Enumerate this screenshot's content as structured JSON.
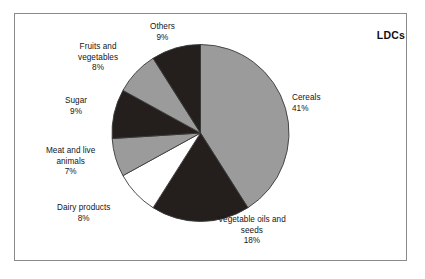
{
  "corner_tag": "LDCs",
  "chart_data": {
    "type": "pie",
    "title": "",
    "subtitle": "",
    "xlabel": "",
    "ylabel": "",
    "legend_position": "none",
    "grid": false,
    "annotation": "LDCs",
    "start_angle_deg": 0,
    "direction": "clockwise",
    "categories": [
      "Cereals",
      "Vegetable oils and seeds",
      "Dairy products",
      "Meat and live animals",
      "Sugar",
      "Fruits and vegetables",
      "Others"
    ],
    "values": [
      41,
      18,
      8,
      7,
      9,
      8,
      9
    ],
    "value_labels": [
      "41%",
      "18%",
      "8%",
      "7%",
      "9%",
      "8%",
      "9%"
    ],
    "colors": [
      "#9b9b9b",
      "#241f1c",
      "#ffffff",
      "#9b9b9b",
      "#241f1c",
      "#9b9b9b",
      "#241f1c"
    ],
    "slices": [
      {
        "label": "Cereals",
        "label_line1": "Cereals",
        "label_line2": "",
        "value": 41,
        "value_label": "41%",
        "color": "#9b9b9b"
      },
      {
        "label": "Vegetable oils and seeds",
        "label_line1": "Vegetable oils and",
        "label_line2": "seeds",
        "value": 18,
        "value_label": "18%",
        "color": "#241f1c"
      },
      {
        "label": "Dairy products",
        "label_line1": "Dairy products",
        "label_line2": "",
        "value": 8,
        "value_label": "8%",
        "color": "#ffffff"
      },
      {
        "label": "Meat and live animals",
        "label_line1": "Meat and live",
        "label_line2": "animals",
        "value": 7,
        "value_label": "7%",
        "color": "#9b9b9b"
      },
      {
        "label": "Sugar",
        "label_line1": "Sugar",
        "label_line2": "",
        "value": 9,
        "value_label": "9%",
        "color": "#241f1c"
      },
      {
        "label": "Fruits and vegetables",
        "label_line1": "Fruits and",
        "label_line2": "vegetables",
        "value": 8,
        "value_label": "8%",
        "color": "#9b9b9b"
      },
      {
        "label": "Others",
        "label_line1": "Others",
        "label_line2": "",
        "value": 9,
        "value_label": "9%",
        "color": "#241f1c"
      }
    ]
  }
}
